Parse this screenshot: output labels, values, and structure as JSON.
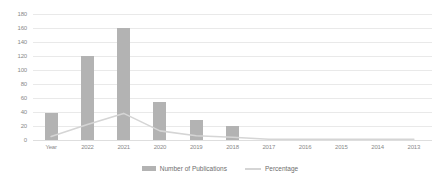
{
  "chart_data": {
    "type": "bar",
    "title": "",
    "xlabel": "",
    "ylabel": "",
    "ylim": [
      0,
      180
    ],
    "ytick_step": 20,
    "grid": true,
    "legend_position": "bottom-center",
    "categories": [
      "Year",
      "2022",
      "2021",
      "2020",
      "2019",
      "2018",
      "2017",
      "2016",
      "2015",
      "2014",
      "2013"
    ],
    "ytick_labels": [
      "180",
      "160",
      "140",
      "120",
      "100",
      "80",
      "60",
      "40",
      "20",
      "0"
    ],
    "series": [
      {
        "name": "Number of Publications",
        "type": "bar",
        "color": "#b3b3b3",
        "values": [
          38,
          120,
          160,
          55,
          28,
          20,
          0,
          0,
          0,
          0,
          0
        ]
      },
      {
        "name": "Percentage",
        "type": "line",
        "color": "#d5d5d5",
        "values": [
          5,
          22,
          38,
          13,
          6,
          4,
          1,
          1,
          1,
          1,
          1
        ]
      }
    ]
  },
  "legend": {
    "items": [
      {
        "label": "Number of Publications",
        "marker": "bar-swatch",
        "color": "#b3b3b3"
      },
      {
        "label": "Percentage",
        "marker": "line-swatch",
        "color": "#d5d5d5"
      }
    ]
  },
  "axes": {
    "y": {
      "min": 0,
      "max": 180,
      "step": 20
    }
  }
}
